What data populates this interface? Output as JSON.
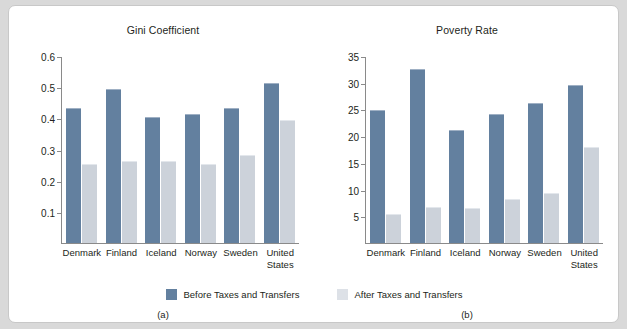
{
  "figure": {
    "legend": [
      {
        "label": "Before Taxes and Transfers",
        "color": "#63809f",
        "key": "before"
      },
      {
        "label": "After Taxes and Transfers",
        "color": "#dde1e7",
        "key": "after"
      }
    ],
    "panel_letters": {
      "a": "(a)",
      "b": "(b)"
    }
  },
  "chart_data": [
    {
      "type": "bar",
      "title": "Gini Coefficient",
      "xlabel": "",
      "ylabel": "",
      "ylim": [
        0,
        0.6
      ],
      "yticks": [
        0.6,
        0.5,
        0.4,
        0.3,
        0.2,
        0.1
      ],
      "ytick_labels": [
        "0.6",
        "0.5",
        "0.4",
        "0.3",
        "0.2",
        "0.1"
      ],
      "grid": false,
      "legend_position": "bottom-center",
      "categories": [
        "Denmark",
        "Finland",
        "Iceland",
        "Norway",
        "Sweden",
        "United States"
      ],
      "series": [
        {
          "name": "Before Taxes and Transfers",
          "values": [
            0.43,
            0.49,
            0.4,
            0.41,
            0.43,
            0.51
          ]
        },
        {
          "name": "After Taxes and Transfers",
          "values": [
            0.25,
            0.26,
            0.26,
            0.25,
            0.28,
            0.39
          ]
        }
      ]
    },
    {
      "type": "bar",
      "title": "Poverty Rate",
      "xlabel": "",
      "ylabel": "",
      "ylim": [
        0,
        35
      ],
      "yticks": [
        35,
        30,
        25,
        20,
        15,
        10,
        5
      ],
      "ytick_labels": [
        "35",
        "30",
        "25",
        "20",
        "15",
        "10",
        "5"
      ],
      "grid": false,
      "legend_position": "bottom-center",
      "categories": [
        "Denmark",
        "Finland",
        "Iceland",
        "Norway",
        "Sweden",
        "United States"
      ],
      "series": [
        {
          "name": "Before Taxes and Transfers",
          "values": [
            24.7,
            32.3,
            20.9,
            23.9,
            26.1,
            29.3
          ]
        },
        {
          "name": "After Taxes and Transfers",
          "values": [
            5.3,
            6.6,
            6.3,
            8.0,
            9.1,
            17.7
          ]
        }
      ]
    }
  ]
}
